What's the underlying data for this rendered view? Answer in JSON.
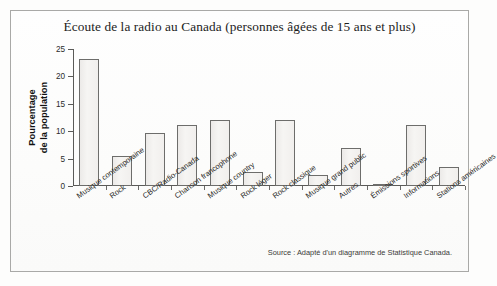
{
  "figure": {
    "title": "Écoute de la radio au Canada (personnes âgées de 15 ans et plus)",
    "source_note": "Source : Adapté d'un diagramme de Statistique Canada.",
    "y_axis_title_line1": "Pourcentage",
    "y_axis_title_line2": "de la population"
  },
  "chart_data": {
    "type": "bar",
    "title": "Écoute de la radio au Canada (personnes âgées de 15 ans et plus)",
    "xlabel": "",
    "ylabel": "Pourcentage de la population",
    "ylim": [
      0,
      25
    ],
    "yticks": [
      0,
      5,
      10,
      15,
      20,
      25
    ],
    "ytick_labels": [
      "0",
      "5",
      "10",
      "15",
      "20",
      "25"
    ],
    "grid": false,
    "legend": "none",
    "bar_fill": "#f1f0ee",
    "bar_edge": "#6d6d6b",
    "categories": [
      "Musique contemporaine",
      "Rock",
      "CBC/Radio-Canada",
      "Chanson francophone",
      "Musique country",
      "Rock léger",
      "Rock classique",
      "Musique grand public",
      "Autres",
      "Émissions sportives",
      "Informations",
      "Stations américaines"
    ],
    "values": [
      23.1,
      5.4,
      9.7,
      11.2,
      12.0,
      2.6,
      12.0,
      2.1,
      7.0,
      0.3,
      11.1,
      3.4
    ],
    "annotations": [
      "Source : Adapté d'un diagramme de Statistique Canada."
    ]
  }
}
